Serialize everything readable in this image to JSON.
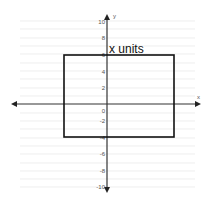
{
  "diagram": {
    "label": "x units",
    "axis_x_label": "x",
    "axis_y_label": "y",
    "y_ticks": [
      "10",
      "8",
      "6",
      "4",
      "2",
      "0",
      "-2",
      "-4",
      "-6",
      "-8",
      "-10"
    ],
    "rectangle": {
      "x_left": -5.2,
      "x_right": 8,
      "y_top": 6,
      "y_bottom": -4
    },
    "colors": {
      "grid": "#dddddd",
      "axis": "#333333",
      "rect": "#111111"
    }
  }
}
